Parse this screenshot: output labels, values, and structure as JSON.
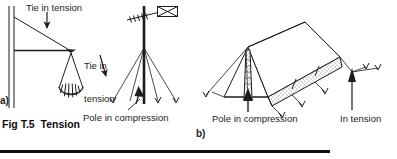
{
  "figure": {
    "caption": "Fig T.5  Tension",
    "panels": [
      {
        "id": "a",
        "marker": "a)",
        "name": "wall-bracket-with-hanging-load",
        "labels": [
          {
            "name": "tie-in-tension",
            "text": "Tie in tension"
          }
        ]
      },
      {
        "id": "mast",
        "name": "guyed-antenna-mast",
        "labels": [
          {
            "name": "tie-in-tension",
            "text": "Tie in\ntension",
            "line1": "Tie in",
            "line2": "tension"
          },
          {
            "name": "pole-in-compression",
            "text": "Pole in compression"
          }
        ]
      },
      {
        "id": "b",
        "marker": "b)",
        "name": "ridge-tent-with-guy-ropes",
        "labels": [
          {
            "name": "pole-in-compression",
            "text": "Pole in compression"
          },
          {
            "name": "in-tension",
            "text": "In tension"
          }
        ]
      }
    ],
    "colors": {
      "ink": "#1c1c1c",
      "rule": "#111111",
      "paper": "#ffffff",
      "hatch": "#555555"
    }
  },
  "texts": {
    "tie_in_tension": "Tie in tension",
    "tie_in": "Tie in",
    "tension": "tension",
    "pole_in_compression_mast": "Pole in compression",
    "pole_in_compression_tent": "Pole in compression",
    "in_tension": "In tension",
    "marker_a": "a)",
    "marker_b": "b)",
    "caption": "Fig T.5  Tension"
  }
}
